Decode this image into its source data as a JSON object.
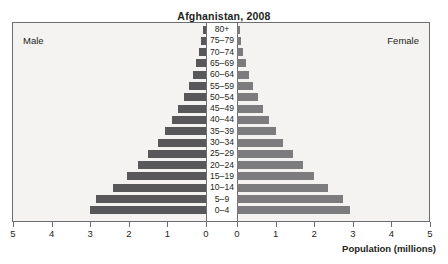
{
  "chart_data": {
    "type": "bar",
    "subtype": "population-pyramid",
    "title": "Afghanistan, 2008",
    "xlabel": "Population (millions)",
    "ylabel": "",
    "xlim": [
      0,
      5
    ],
    "xticks": [
      5,
      4,
      3,
      2,
      1,
      0,
      0,
      1,
      2,
      3,
      4,
      5
    ],
    "xticklabels": [
      "5",
      "4",
      "3",
      "2",
      "1",
      "0",
      "0",
      "1",
      "2",
      "3",
      "4",
      "5"
    ],
    "grid": false,
    "legend_position": "inline-corners",
    "left_side_label": "Male",
    "right_side_label": "Female",
    "categories": [
      "80+",
      "75–79",
      "70–74",
      "65–69",
      "60–64",
      "55–59",
      "50–54",
      "45–49",
      "40–44",
      "35–39",
      "30–34",
      "25–29",
      "20–24",
      "15–19",
      "10–14",
      "5–9",
      "0–4"
    ],
    "series": [
      {
        "name": "Male",
        "color": "#58585a",
        "values": [
          0.08,
          0.12,
          0.18,
          0.25,
          0.33,
          0.45,
          0.58,
          0.72,
          0.88,
          1.05,
          1.25,
          1.5,
          1.75,
          2.05,
          2.4,
          2.85,
          3.0
        ]
      },
      {
        "name": "Female",
        "color": "#7c7c7e",
        "values": [
          0.07,
          0.11,
          0.16,
          0.23,
          0.3,
          0.42,
          0.55,
          0.68,
          0.84,
          1.0,
          1.2,
          1.45,
          1.7,
          2.0,
          2.35,
          2.75,
          2.93
        ]
      }
    ]
  },
  "style": {
    "plot_background": "#f4f3f1",
    "frame_color": "#6d6e71",
    "text_color": "#231f20",
    "page_background": "#ffffff"
  }
}
